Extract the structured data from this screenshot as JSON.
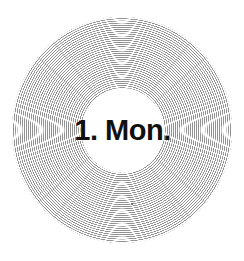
{
  "disc": {
    "label": "1. Mon.",
    "ring_color": "#8c8c8c",
    "background_color": "#ffffff",
    "text_color": "#111111"
  }
}
